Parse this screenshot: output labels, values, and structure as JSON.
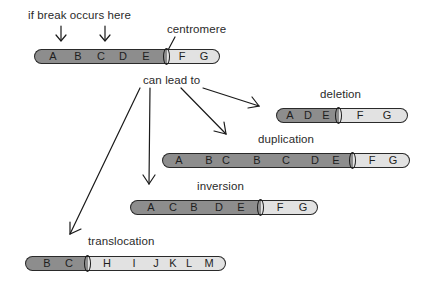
{
  "labels": {
    "break_note": "if break occurs here",
    "centromere": "centromere",
    "can_lead_to": "can lead to",
    "deletion": "deletion",
    "duplication": "duplication",
    "inversion": "inversion",
    "translocation": "translocation"
  },
  "colors": {
    "left_arm": "#8d8d8d",
    "right_arm": "#e2e2e2",
    "outline": "#2a2a2a"
  },
  "chromosomes": {
    "original": {
      "left": [
        "A",
        "B",
        "C",
        "D",
        "E"
      ],
      "right": [
        "F",
        "G"
      ]
    },
    "deletion": {
      "left": [
        "A",
        "D",
        "E"
      ],
      "right": [
        "F",
        "G"
      ]
    },
    "duplication": {
      "left": [
        "A",
        "B",
        "C",
        "B",
        "C",
        "D",
        "E"
      ],
      "right": [
        "F",
        "G"
      ]
    },
    "inversion": {
      "left": [
        "A",
        "C",
        "B",
        "D",
        "E"
      ],
      "right": [
        "F",
        "G"
      ]
    },
    "translocation": {
      "left": [
        "B",
        "C"
      ],
      "right": [
        "H",
        "I",
        "J",
        "K",
        "L",
        "M"
      ]
    }
  }
}
